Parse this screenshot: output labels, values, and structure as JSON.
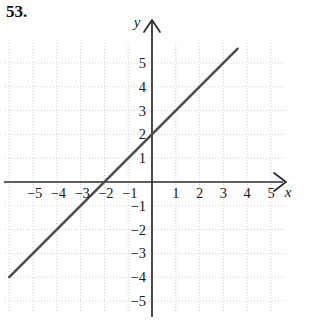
{
  "problem": {
    "number": "53."
  },
  "chart_data": {
    "type": "line",
    "title": "",
    "xlabel": "x",
    "ylabel": "y",
    "xlim": [
      -6.1,
      5.55
    ],
    "ylim": [
      -6.1,
      6.1
    ],
    "grid": true,
    "grid_style": "dotted",
    "grid_color": "#cfcfcf",
    "axis_color": "#2b2b2b",
    "line_color": "#4a4a4a",
    "legend": "none",
    "equation": "y = x + 2",
    "slope": 1,
    "y_intercept": 2,
    "x_intercept": -2,
    "x_ticks": [
      -5,
      -4,
      -3,
      -2,
      -1,
      1,
      2,
      3,
      4,
      5
    ],
    "x_tick_labels": [
      "−5",
      "−4",
      "−3",
      "−2",
      "−1",
      "1",
      "2",
      "3",
      "4",
      "5"
    ],
    "y_ticks": [
      5,
      4,
      3,
      2,
      1,
      -1,
      -2,
      -3,
      -4,
      -5
    ],
    "y_tick_labels": [
      "5",
      "4",
      "3",
      "2",
      "1",
      "−1",
      "−2",
      "−3",
      "−4",
      "−5"
    ],
    "series": [
      {
        "name": "y = x + 2",
        "x": [
          -6.0,
          3.6
        ],
        "values": [
          -4.0,
          5.6
        ]
      }
    ],
    "points": [
      {
        "x": -2,
        "y": 0,
        "label": "x-intercept"
      },
      {
        "x": 0,
        "y": 2,
        "label": "y-intercept"
      }
    ]
  }
}
